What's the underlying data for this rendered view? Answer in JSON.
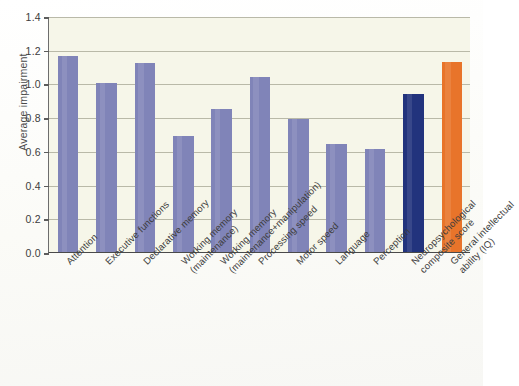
{
  "chart_data": {
    "type": "bar",
    "title": "",
    "xlabel": "",
    "ylabel": "Average impairment",
    "ylim": [
      0.0,
      1.4
    ],
    "ytick_labels": [
      "0.0",
      "0.2",
      "0.4",
      "0.6",
      "0.8",
      "1.0",
      "1.2",
      "1.4"
    ],
    "ytick_values": [
      0.0,
      0.2,
      0.4,
      0.6,
      0.8,
      1.0,
      1.2,
      1.4
    ],
    "grid": "horizontal",
    "legend": "none",
    "categories": [
      "Attention",
      "Executive functions",
      "Declarative memory",
      "Working memory (maintenance)",
      "Working memory (maintenance+manipulation)",
      "Processing speed",
      "Motor speed",
      "Language",
      "Perception",
      "Neuropsychological composite score",
      "General intellectual ability (IQ)"
    ],
    "category_lines": [
      [
        "Attention",
        ""
      ],
      [
        "Executive functions",
        ""
      ],
      [
        "Declarative memory",
        ""
      ],
      [
        "Working memory",
        "(maintenance)"
      ],
      [
        "Working memory",
        "(maintenance+manipulation)"
      ],
      [
        "Processing speed",
        ""
      ],
      [
        "Motor speed",
        ""
      ],
      [
        "Language",
        ""
      ],
      [
        "Perception",
        ""
      ],
      [
        "Neuropsychological",
        "composite score"
      ],
      [
        "General intellectual",
        "ability (IQ)"
      ]
    ],
    "values": [
      1.16,
      1.0,
      1.12,
      0.69,
      0.85,
      1.04,
      0.79,
      0.64,
      0.61,
      0.94,
      1.13
    ],
    "bar_colors": [
      "#8084b8",
      "#8084b8",
      "#8084b8",
      "#8084b8",
      "#8084b8",
      "#8084b8",
      "#8084b8",
      "#8084b8",
      "#8084b8",
      "#22337d",
      "#e8742a"
    ]
  },
  "colors": {
    "domain_bar": "#8084b8",
    "composite_bar": "#22337d",
    "iq_bar": "#e8742a",
    "plot_background": "#f6f6e9",
    "gridline": "#b9b9a8",
    "axis": "#5c5c5c",
    "text": "#3d3d3d"
  },
  "caption": {
    "remnant": ""
  }
}
